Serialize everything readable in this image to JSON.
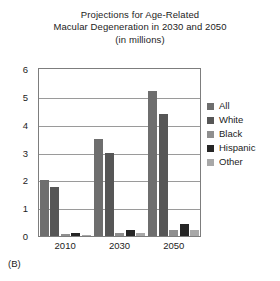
{
  "figure": {
    "panel_label": "(B)",
    "title_lines": [
      "Projections for Age-Related",
      "Macular Degeneration in 2030 and 2050",
      "(in millions)"
    ]
  },
  "legend": {
    "position": "right",
    "entries": [
      {
        "label": "All",
        "color": "#6e6e6e"
      },
      {
        "label": "White",
        "color": "#565656"
      },
      {
        "label": "Black",
        "color": "#8f8f8f"
      },
      {
        "label": "Hispanic",
        "color": "#262626"
      },
      {
        "label": "Other",
        "color": "#a8a8a8"
      }
    ]
  },
  "axes": {
    "y_ticks": [
      "0",
      "1",
      "2",
      "3",
      "4",
      "5",
      "6"
    ],
    "x_ticks": [
      "2010",
      "2030",
      "2050"
    ]
  },
  "chart_data": {
    "type": "bar",
    "title": "Projections for Age-Related Macular Degeneration in 2030 and 2050 (in millions)",
    "xlabel": "",
    "ylabel": "",
    "ylim": [
      0,
      6
    ],
    "ytick_step": 1,
    "grid": true,
    "legend_position": "right",
    "categories": [
      "2010",
      "2030",
      "2050"
    ],
    "series": [
      {
        "name": "All",
        "color": "#6e6e6e",
        "values": [
          2.0,
          3.5,
          5.2
        ]
      },
      {
        "name": "White",
        "color": "#565656",
        "values": [
          1.75,
          3.0,
          4.4
        ]
      },
      {
        "name": "Black",
        "color": "#8f8f8f",
        "values": [
          0.08,
          0.12,
          0.2
        ]
      },
      {
        "name": "Hispanic",
        "color": "#262626",
        "values": [
          0.1,
          0.2,
          0.42
        ]
      },
      {
        "name": "Other",
        "color": "#a8a8a8",
        "values": [
          0.05,
          0.1,
          0.2
        ]
      }
    ]
  }
}
